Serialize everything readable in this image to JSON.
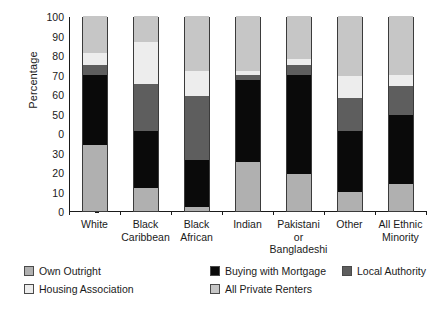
{
  "chart_data": {
    "type": "bar",
    "subtype": "stacked-percentage",
    "title": "",
    "xlabel": "",
    "ylabel": "Percentage",
    "ylim": [
      0,
      100
    ],
    "ytick_labels": [
      "100",
      "90",
      "80",
      "70",
      "60",
      "50",
      "0",
      "30",
      "20",
      "10",
      "0"
    ],
    "ytick_values": [
      100,
      90,
      80,
      70,
      60,
      50,
      40,
      30,
      20,
      10,
      0
    ],
    "grid": false,
    "legend_position": "bottom-left",
    "categories": [
      "White",
      "Black Caribbean",
      "Black African",
      "Indian",
      "Pakistani or Bangladeshi",
      "Other",
      "All Ethnic Minority"
    ],
    "category_label_lines": [
      [
        "White"
      ],
      [
        "Black",
        "Caribbean"
      ],
      [
        "Black",
        "African"
      ],
      [
        "Indian"
      ],
      [
        "Pakistani",
        "or",
        "Bangladeshi"
      ],
      [
        "Other"
      ],
      [
        "All Ethnic",
        "Minority"
      ]
    ],
    "series": [
      {
        "name": "Own Outright",
        "color": "#b0b0b0",
        "values": [
          34,
          12,
          2,
          25,
          19,
          10,
          14
        ]
      },
      {
        "name": "Buying with Mortgage",
        "color": "#0a0a0a",
        "values": [
          36,
          29,
          24,
          42,
          51,
          31,
          35
        ]
      },
      {
        "name": "Local Authority",
        "color": "#5e5e5e",
        "values": [
          5,
          24,
          33,
          3,
          5,
          17,
          15
        ]
      },
      {
        "name": "Housing Association",
        "color": "#ededed",
        "values": [
          6,
          21.5,
          13,
          2,
          3,
          11,
          6
        ]
      },
      {
        "name": "All Private Renters",
        "color": "#c6c6c6",
        "values": [
          19,
          13.5,
          28,
          28,
          22,
          31,
          30
        ]
      }
    ]
  },
  "legend": {
    "items": [
      {
        "label": "Own Outright",
        "color": "#b0b0b0"
      },
      {
        "label": "Buying with Mortgage",
        "color": "#0a0a0a"
      },
      {
        "label": "Local Authority",
        "color": "#5e5e5e"
      },
      {
        "label": "Housing Association",
        "color": "#ededed"
      },
      {
        "label": "All Private Renters",
        "color": "#c6c6c6"
      }
    ]
  }
}
